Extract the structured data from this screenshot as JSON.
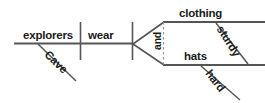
{
  "diagram": {
    "type": "reed-kellogg-sentence-diagram",
    "sentence": "Cave explorers wear sturdy clothing and hard hats.",
    "colors": {
      "line": "#555555",
      "line_light": "#9a9a9a",
      "text": "#1b1b1b",
      "background": "#ffffff"
    },
    "subject": {
      "label": "explorers",
      "modifier": "Cave"
    },
    "verb": {
      "label": "wear"
    },
    "conjunction": {
      "label": "and"
    },
    "objects": [
      {
        "label": "clothing",
        "modifier": "sturdy"
      },
      {
        "label": "hats",
        "modifier": "hard"
      }
    ]
  }
}
